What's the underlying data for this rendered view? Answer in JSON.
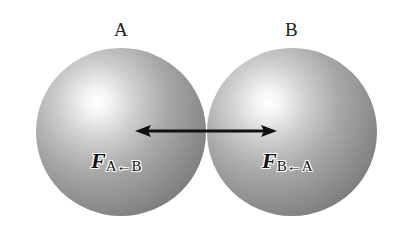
{
  "diagram": {
    "spheres": [
      {
        "label": "A",
        "force_symbol": "F",
        "force_subscript": "A←B"
      },
      {
        "label": "B",
        "force_symbol": "F",
        "force_subscript": "B←A"
      }
    ],
    "arrow": {
      "type": "double-headed",
      "color": "#111111",
      "from_x": 135,
      "to_x": 276,
      "y": 131
    }
  }
}
